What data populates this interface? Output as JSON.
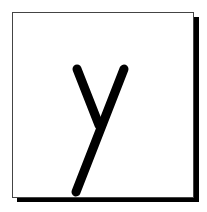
{
  "card": {
    "letter": "y",
    "colors": {
      "background": "#ffffff",
      "border": "#444444",
      "shadow": "#000000",
      "stroke": "#000000"
    }
  }
}
